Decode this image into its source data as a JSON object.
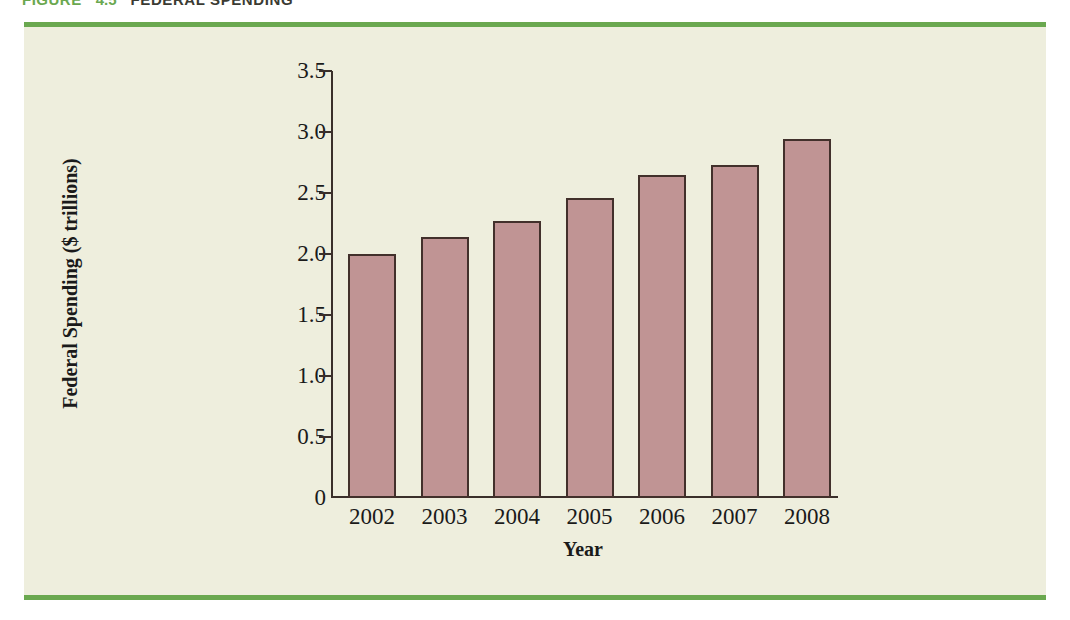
{
  "figure_header": {
    "label": "FIGURE",
    "number": "4.5",
    "title": "FEDERAL SPENDING"
  },
  "colors": {
    "panel_background": "#eeeedd",
    "rule_green": "#6aa84f",
    "bar_fill": "#c09494",
    "bar_outline": "#42302b",
    "axis": "#3a2f2a",
    "text": "#1a1a1a"
  },
  "chart_data": {
    "type": "bar",
    "title": "FEDERAL SPENDING",
    "xlabel": "Year",
    "ylabel": "Federal Spending ($ trillions)",
    "categories": [
      "2002",
      "2003",
      "2004",
      "2005",
      "2006",
      "2007",
      "2008"
    ],
    "values": [
      2.0,
      2.14,
      2.27,
      2.46,
      2.65,
      2.73,
      2.94
    ],
    "ylim": [
      0,
      3.5
    ],
    "yticks": [
      0,
      0.5,
      1.0,
      1.5,
      2.0,
      2.5,
      3.0,
      3.5
    ],
    "ytick_labels": [
      "0",
      "0.5",
      "1.0",
      "1.5",
      "2.0",
      "2.5",
      "3.0",
      "3.5"
    ],
    "grid": false,
    "legend": null
  }
}
